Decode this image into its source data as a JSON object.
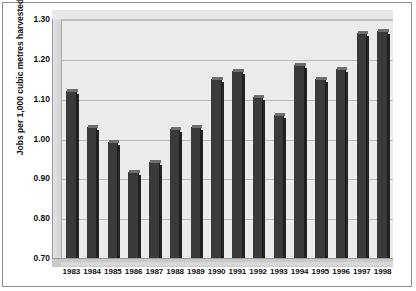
{
  "chart_data": {
    "type": "bar",
    "title": "",
    "subtitle": "",
    "xlabel": "",
    "ylabel": "Jobs per 1,000 cubic metres harvested",
    "categories": [
      "1983",
      "1984",
      "1985",
      "1986",
      "1987",
      "1988",
      "1989",
      "1990",
      "1991",
      "1992",
      "1993",
      "1994",
      "1995",
      "1996",
      "1997",
      "1998"
    ],
    "values": [
      1.12,
      1.03,
      0.99,
      0.915,
      0.94,
      1.025,
      1.03,
      1.15,
      1.17,
      1.105,
      1.06,
      1.185,
      1.15,
      1.175,
      1.265,
      1.27
    ],
    "ylim": [
      0.7,
      1.3
    ],
    "ytick_labels": [
      "1.30",
      "1.20",
      "1.10",
      "1.00",
      "0.90",
      "0.80",
      "0.70"
    ],
    "ytick_values": [
      1.3,
      1.2,
      1.1,
      1.0,
      0.9,
      0.8,
      0.7
    ],
    "grid": true,
    "legend": "none",
    "style": "3d-column",
    "colors": {
      "bar": "#3a3a3a",
      "bar_top": "#6e6e6e",
      "plot_background": "#ebebeb",
      "gridline": "#bcbcbc",
      "frame": "#8d8d8d",
      "text": "#101010"
    }
  }
}
